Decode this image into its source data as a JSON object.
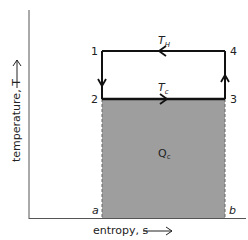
{
  "diagram": {
    "type": "T-s diagram (reversed Carnot / refrigeration cycle)",
    "axes": {
      "x_label": "entropy, s",
      "y_label": "temperature, T"
    },
    "points": [
      {
        "id": "1",
        "label": "1"
      },
      {
        "id": "2",
        "label": "2"
      },
      {
        "id": "3",
        "label": "3"
      },
      {
        "id": "4",
        "label": "4"
      }
    ],
    "temperatures": {
      "hot": "T",
      "hot_sub": "H",
      "cold": "T",
      "cold_sub": "c"
    },
    "area_label": "Q",
    "area_label_sub": "c",
    "entropy_bounds": {
      "a": "a",
      "b": "b"
    },
    "colors": {
      "line": "#111111",
      "shaded_area": "#9a9a9a",
      "axis": "#555555"
    }
  }
}
